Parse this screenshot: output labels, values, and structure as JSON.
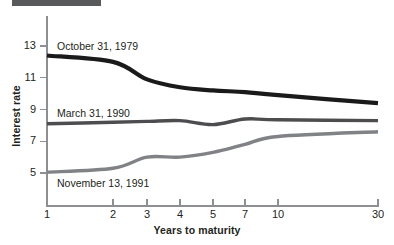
{
  "figure": {
    "top_rule_color": "#58595b"
  },
  "chart_data": {
    "type": "line",
    "title": "",
    "xlabel": "Years to maturity",
    "ylabel": "Interest rate",
    "categories": [
      "1",
      "2",
      "3",
      "4",
      "5",
      "7",
      "10",
      "30"
    ],
    "x_tick_labels": [
      "1",
      "2",
      "3",
      "4",
      "5",
      "7",
      "10",
      "30"
    ],
    "y_tick_labels": [
      "13",
      "11",
      "9",
      "7",
      "5"
    ],
    "y_ticks": [
      13,
      11,
      9,
      7,
      5
    ],
    "ylim": [
      4.2,
      13.6
    ],
    "grid": false,
    "legend_position": "inline-annotations",
    "series": [
      {
        "name": "October 31, 1979",
        "color": "#1a1a1a",
        "width": 4.2,
        "values": [
          12.4,
          12.0,
          10.9,
          10.4,
          10.2,
          10.1,
          9.9,
          9.4
        ]
      },
      {
        "name": "March 31, 1990",
        "color": "#4d4d4f",
        "width": 3.4,
        "values": [
          8.1,
          8.2,
          8.25,
          8.3,
          8.05,
          8.4,
          8.35,
          8.3
        ]
      },
      {
        "name": "November 13, 1991",
        "color": "#808285",
        "width": 3.4,
        "values": [
          5.05,
          5.3,
          6.0,
          6.0,
          6.3,
          6.8,
          7.3,
          7.6
        ]
      }
    ],
    "annotations": [
      {
        "text": "October 31, 1979",
        "series": 0
      },
      {
        "text": "March 31, 1990",
        "series": 1
      },
      {
        "text": "November 13, 1991",
        "series": 2
      }
    ]
  }
}
